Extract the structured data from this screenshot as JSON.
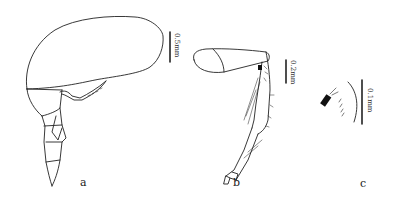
{
  "figure": {
    "panels": [
      {
        "id": "a",
        "label": "a",
        "scale_bar": "0.5mm"
      },
      {
        "id": "b",
        "label": "b",
        "scale_bar": "0.2mm"
      },
      {
        "id": "c",
        "label": "c",
        "scale_bar": "0.1mm"
      }
    ],
    "colors": {
      "line": "#222222",
      "background": "#ffffff"
    }
  }
}
